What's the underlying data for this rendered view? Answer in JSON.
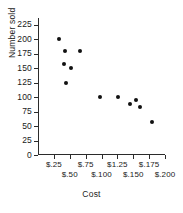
{
  "chart_data": {
    "type": "scatter",
    "title": "",
    "xlabel": "Cost",
    "ylabel": "Number sold",
    "xlim": [
      0,
      8
    ],
    "ylim": [
      0,
      237
    ],
    "grid": false,
    "legend": false,
    "y_ticks": [
      {
        "value": 225,
        "label": "225"
      },
      {
        "value": 200,
        "label": "200"
      },
      {
        "value": 175,
        "label": "175"
      },
      {
        "value": 150,
        "label": "150"
      },
      {
        "value": 125,
        "label": "125"
      },
      {
        "value": 100,
        "label": "100"
      },
      {
        "value": 75,
        "label": "75"
      },
      {
        "value": 50,
        "label": "50"
      },
      {
        "value": 25,
        "label": "25"
      },
      {
        "value": 0,
        "label": "0"
      }
    ],
    "x_ticks": [
      {
        "index": 1,
        "label": "$.25",
        "row": 0
      },
      {
        "index": 2,
        "label": "$.50",
        "row": 1
      },
      {
        "index": 3,
        "label": "$.75",
        "row": 0
      },
      {
        "index": 4,
        "label": "$.100",
        "row": 1
      },
      {
        "index": 5,
        "label": "$1.25",
        "row": 0
      },
      {
        "index": 6,
        "label": "$.150",
        "row": 1
      },
      {
        "index": 7,
        "label": "$.175",
        "row": 0
      },
      {
        "index": 8,
        "label": "$.200",
        "row": 1
      }
    ],
    "points": [
      {
        "x": 1.35,
        "y": 200
      },
      {
        "x": 1.7,
        "y": 180
      },
      {
        "x": 1.62,
        "y": 157
      },
      {
        "x": 2.62,
        "y": 180
      },
      {
        "x": 2.05,
        "y": 151
      },
      {
        "x": 1.78,
        "y": 124
      },
      {
        "x": 3.88,
        "y": 100
      },
      {
        "x": 5.05,
        "y": 100
      },
      {
        "x": 5.78,
        "y": 88
      },
      {
        "x": 6.18,
        "y": 96
      },
      {
        "x": 6.45,
        "y": 83
      },
      {
        "x": 7.18,
        "y": 57
      }
    ]
  }
}
